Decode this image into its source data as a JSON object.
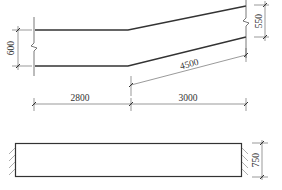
{
  "elevation": {
    "left_height_label": "600",
    "right_height_label": "550",
    "sloped_length_label": "4500",
    "span_labels": [
      "2800",
      "3000"
    ]
  },
  "plan": {
    "width_label": "750"
  },
  "colors": {
    "line": "#333333",
    "thin_line": "#555555",
    "background": "#ffffff"
  }
}
